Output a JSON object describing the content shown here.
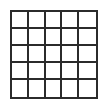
{
  "grid": {
    "rows": 5,
    "columns": 5,
    "line_color": "#2b2b2b",
    "cell_color": "#ffffff",
    "cells": [
      [
        "",
        "",
        "",
        "",
        ""
      ],
      [
        "",
        "",
        "",
        "",
        ""
      ],
      [
        "",
        "",
        "",
        "",
        ""
      ],
      [
        "",
        "",
        "",
        "",
        ""
      ],
      [
        "",
        "",
        "",
        "",
        ""
      ]
    ]
  }
}
